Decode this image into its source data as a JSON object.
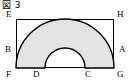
{
  "figure": {
    "caption": "図 3",
    "shape_name": "annular-sector-in-rectangle",
    "rectangle": {
      "x": 16,
      "y": 19,
      "width": 98,
      "height": 49,
      "stroke": "#000000",
      "stroke_width": 1,
      "fill": "none"
    },
    "annular_sector": {
      "center_x": 65,
      "center_y": 68,
      "outer_radius": 49,
      "inner_radius": 20,
      "start_angle_deg": 180,
      "end_angle_deg": 360,
      "fill": "#e3e3e3",
      "stroke": "#000000",
      "stroke_width": 1.4
    },
    "labels": {
      "E": "E",
      "H": "H",
      "B": "B",
      "A": "A",
      "F": "F",
      "D": "D",
      "C": "C",
      "G": "G"
    },
    "colors": {
      "ink": "#000000",
      "shade": "#e3e3e3",
      "background": "#ffffff"
    }
  }
}
